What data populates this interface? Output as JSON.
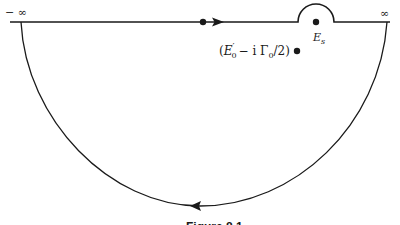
{
  "diagram": {
    "type": "contour-integration",
    "labels": {
      "left_infinity": "− ∞",
      "right_infinity": "∞",
      "singular_point": "E",
      "singular_point_sub": "s",
      "pole_open": "(",
      "pole_E": "E",
      "pole_E_prime": "′",
      "pole_E_sub": "0",
      "pole_minus_i": "− i  Γ",
      "pole_gamma_sub": "0",
      "pole_tail": "/2)",
      "caption": "Figure 8.1"
    },
    "elements": {
      "real_axis": {
        "from_x": 10,
        "to_x": 390,
        "y": 22
      },
      "real_axis_point": {
        "x": 203,
        "y": 22
      },
      "forward_arrow": {
        "x": 218,
        "y": 22,
        "direction": "right"
      },
      "indentation": {
        "center_x": 316,
        "center_y": 22,
        "radius": 18,
        "side": "above"
      },
      "lower_contour": {
        "from_x": 21,
        "to_x": 387,
        "bottom_y": 206,
        "direction": "clockwise-return"
      },
      "return_arrow": {
        "x": 196,
        "y": 206,
        "direction": "left"
      },
      "pole_point": {
        "x": 297,
        "y": 51
      }
    },
    "colors": {
      "ink": "#1a1a1a",
      "background": "#ffffff"
    }
  }
}
